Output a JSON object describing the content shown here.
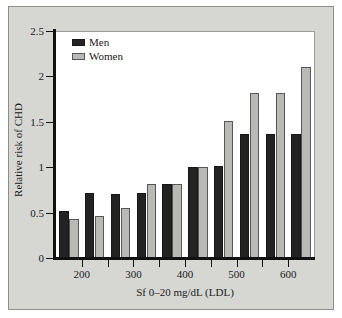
{
  "chart_data": {
    "type": "bar",
    "title": "",
    "subtitle": "",
    "xlabel": "Sf 0–20 mg/dL (LDL)",
    "ylabel": "Relative risk of CHD",
    "ylim": [
      0,
      2.5
    ],
    "yticks": [
      0,
      0.5,
      1,
      1.5,
      2,
      2.5
    ],
    "ytick_labels": [
      "0",
      "0.5",
      "1",
      "1.5",
      "2",
      "2.5"
    ],
    "xtick_labels": [
      "200",
      "300",
      "400",
      "500",
      "600"
    ],
    "xtick_group_index": [
      1,
      3,
      5,
      7,
      9
    ],
    "categories": [
      "1",
      "2",
      "3",
      "4",
      "5",
      "6",
      "7",
      "8",
      "9",
      "10"
    ],
    "grid": false,
    "legend_position": "top-left",
    "series": [
      {
        "name": "Men",
        "color": "#232323",
        "values": [
          0.53,
          0.73,
          0.72,
          0.73,
          0.83,
          1.01,
          1.02,
          1.38,
          1.38,
          1.38
        ]
      },
      {
        "name": "Women",
        "color": "#b9b9b6",
        "values": [
          0.44,
          0.47,
          0.56,
          0.83,
          0.83,
          1.01,
          1.52,
          1.83,
          1.83,
          2.11
        ]
      }
    ]
  },
  "legend": {
    "items": [
      {
        "label": "Men",
        "series": "men"
      },
      {
        "label": "Women",
        "series": "women"
      }
    ]
  },
  "colors": {
    "figure_background": "#d6d6d3",
    "plot_background": "#ffffff",
    "axis": "#111111",
    "men": "#232323",
    "women": "#b9b9b6"
  }
}
